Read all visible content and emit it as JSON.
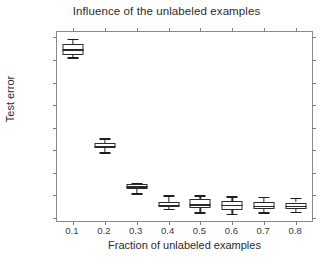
{
  "chart_data": {
    "type": "box",
    "title": "Influence of the unlabeled examples",
    "xlabel": "Fraction of unlabeled examples",
    "ylabel": "Test error",
    "grid": false,
    "legend": null,
    "xlim": [
      0.05,
      0.85
    ],
    "ylim": [
      0.043,
      0.462
    ],
    "yticks": [
      0.05,
      0.1,
      0.15,
      0.2,
      0.25,
      0.3,
      0.35,
      0.4,
      0.45
    ],
    "ytick_labels": [
      "0.05",
      "0.1",
      "0.15",
      "0.2",
      "0.25",
      "0.3",
      "0.35",
      "0.4",
      "0.45"
    ],
    "xticks": [
      0.1,
      0.2,
      0.3,
      0.4,
      0.5,
      0.6,
      0.7,
      0.8
    ],
    "xtick_labels": [
      "0.1",
      "0.2",
      "0.3",
      "0.4",
      "0.5",
      "0.6",
      "0.7",
      "0.8"
    ],
    "categories": [
      "0.1",
      "0.2",
      "0.3",
      "0.4",
      "0.5",
      "0.6",
      "0.7",
      "0.8"
    ],
    "boxes": [
      {
        "x": 0.1,
        "whisker_low": 0.406,
        "q1": 0.412,
        "median": 0.424,
        "q3": 0.436,
        "whisker_high": 0.447
      },
      {
        "x": 0.2,
        "whisker_low": 0.196,
        "q1": 0.204,
        "median": 0.21,
        "q3": 0.217,
        "whisker_high": 0.227
      },
      {
        "x": 0.3,
        "whisker_low": 0.105,
        "q1": 0.113,
        "median": 0.12,
        "q3": 0.125,
        "whisker_high": 0.128
      },
      {
        "x": 0.4,
        "whisker_low": 0.07,
        "q1": 0.074,
        "median": 0.079,
        "q3": 0.085,
        "whisker_high": 0.1
      },
      {
        "x": 0.5,
        "whisker_low": 0.063,
        "q1": 0.072,
        "median": 0.08,
        "q3": 0.091,
        "whisker_high": 0.1
      },
      {
        "x": 0.6,
        "whisker_low": 0.059,
        "q1": 0.068,
        "median": 0.079,
        "q3": 0.088,
        "whisker_high": 0.098
      },
      {
        "x": 0.7,
        "whisker_low": 0.062,
        "q1": 0.07,
        "median": 0.077,
        "q3": 0.086,
        "whisker_high": 0.097
      },
      {
        "x": 0.8,
        "whisker_low": 0.064,
        "q1": 0.07,
        "median": 0.077,
        "q3": 0.084,
        "whisker_high": 0.095
      }
    ],
    "colors": {
      "line": "#2a2a2a",
      "axis": "#8a8a8a",
      "text": "#2b2b2b",
      "background": "#ffffff"
    }
  }
}
